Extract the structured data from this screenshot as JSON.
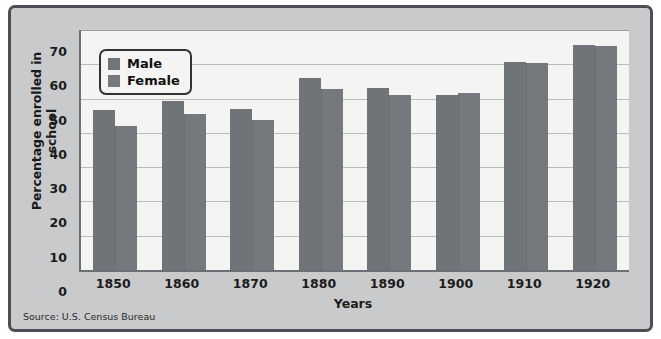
{
  "figure": {
    "source_note": "Source: U.S. Census Bureau",
    "panel_color": "#c9cacb",
    "plot_color": "#f4f4f2",
    "border_color": "#4a4f55"
  },
  "chart_data": {
    "type": "bar",
    "title": "",
    "xlabel": "Years",
    "ylabel": "Percentage enrolled in school",
    "categories": [
      "1850",
      "1860",
      "1870",
      "1880",
      "1890",
      "1900",
      "1910",
      "1920"
    ],
    "series": [
      {
        "name": "Male",
        "color": "#6f7478",
        "values": [
          46.7,
          49.3,
          47.0,
          56.0,
          53.0,
          51.0,
          60.6,
          65.6
        ]
      },
      {
        "name": "Female",
        "color": "#74797d",
        "values": [
          42.0,
          45.5,
          43.8,
          52.9,
          51.0,
          51.6,
          60.4,
          65.4
        ]
      }
    ],
    "ylim": [
      0,
      70
    ],
    "yticks": [
      0,
      10,
      20,
      30,
      40,
      50,
      60,
      70
    ],
    "ytick_labels": [
      "0",
      "10",
      "20",
      "30",
      "40",
      "50",
      "60",
      "70"
    ],
    "grid": true,
    "legend_position": "upper-left",
    "legend_entries": [
      "Male",
      "Female"
    ]
  }
}
